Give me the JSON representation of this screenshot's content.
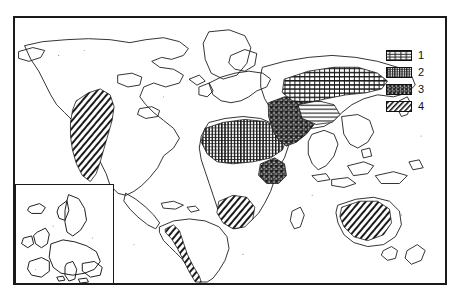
{
  "figure": {
    "kind": "world-map",
    "title": "",
    "background_color": "#ffffff",
    "ink_color": "#1a1a1a",
    "frame": {
      "border_color": "#1a1a1a",
      "border_width_px": 2
    }
  },
  "legend": {
    "position": "right",
    "items": [
      {
        "key": "1",
        "label": "1",
        "pattern": "horizontal-lines-light",
        "swatch_name": "legend-swatch-1"
      },
      {
        "key": "2",
        "label": "2",
        "pattern": "dense-vertical-stipple",
        "swatch_name": "legend-swatch-2"
      },
      {
        "key": "3",
        "label": "3",
        "pattern": "coarse-mottled-dark",
        "swatch_name": "legend-swatch-3"
      },
      {
        "key": "4",
        "label": "4",
        "pattern": "diagonal-hatch",
        "swatch_name": "legend-swatch-4"
      }
    ]
  },
  "inset": {
    "name": "europe-inset",
    "region": "Europe",
    "has_border": true
  },
  "regions": [
    {
      "name": "western-north-america",
      "pattern": "diagonal-hatch",
      "legend_key": "4"
    },
    {
      "name": "andes-south-america",
      "pattern": "diagonal-hatch",
      "legend_key": "4"
    },
    {
      "name": "north-africa-sahara",
      "pattern": "dense-vertical-stipple",
      "legend_key": "2"
    },
    {
      "name": "middle-east-arabia",
      "pattern": "coarse-mottled-dark",
      "legend_key": "3"
    },
    {
      "name": "central-asia",
      "pattern": "horizontal-lines-light",
      "legend_key": "1"
    },
    {
      "name": "horn-of-africa",
      "pattern": "coarse-mottled-dark",
      "legend_key": "3"
    },
    {
      "name": "southern-africa",
      "pattern": "diagonal-hatch",
      "legend_key": "4"
    },
    {
      "name": "australia-interior",
      "pattern": "diagonal-hatch",
      "legend_key": "4"
    }
  ]
}
